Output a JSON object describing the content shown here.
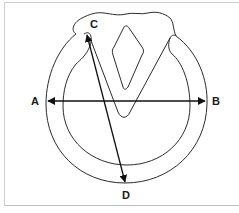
{
  "diagram": {
    "labels": {
      "a": "A",
      "b": "B",
      "c": "C",
      "d": "D"
    },
    "measurements": [
      {
        "name": "width",
        "from": "A",
        "to": "B",
        "style": "double-arrow"
      },
      {
        "name": "length",
        "from": "C",
        "to": "D",
        "style": "double-arrow"
      }
    ],
    "colors": {
      "stroke": "#2b2b2b",
      "arrow": "#111111",
      "frame": "#cfcfcf",
      "background": "#ffffff"
    }
  }
}
